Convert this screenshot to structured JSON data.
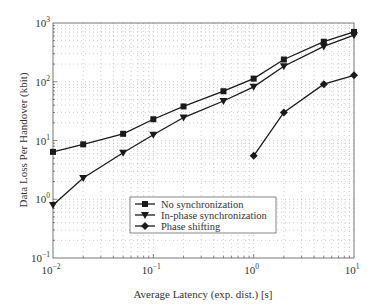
{
  "chart_data": {
    "type": "line",
    "title": "",
    "xlabel": "Average Latency (exp. dist.) [s]",
    "ylabel": "Data Loss Per Handover (kbit)",
    "xscale": "log",
    "yscale": "log",
    "xlim": [
      0.01,
      10
    ],
    "ylim": [
      0.1,
      1000
    ],
    "grid": true,
    "legend_position": "lower center (inside)",
    "x_ticks": [
      {
        "value": 0.01,
        "base": "10",
        "exp": "−2"
      },
      {
        "value": 0.1,
        "base": "10",
        "exp": "−1"
      },
      {
        "value": 1,
        "base": "10",
        "exp": "0"
      },
      {
        "value": 10,
        "base": "10",
        "exp": "1"
      }
    ],
    "y_ticks": [
      {
        "value": 0.1,
        "base": "10",
        "exp": "−1"
      },
      {
        "value": 1,
        "base": "10",
        "exp": "0"
      },
      {
        "value": 10,
        "base": "10",
        "exp": "1"
      },
      {
        "value": 100,
        "base": "10",
        "exp": "2"
      },
      {
        "value": 1000,
        "base": "10",
        "exp": "3"
      }
    ],
    "series": [
      {
        "name": "No synchronization",
        "marker": "square",
        "x": [
          0.01,
          0.02,
          0.05,
          0.1,
          0.2,
          0.5,
          1,
          2,
          5,
          10
        ],
        "values": [
          6.4,
          8.6,
          13,
          23,
          38,
          69,
          113,
          239,
          480,
          705
        ]
      },
      {
        "name": "In-phase synchronization",
        "marker": "triangle-down",
        "x": [
          0.01,
          0.02,
          0.05,
          0.1,
          0.2,
          0.5,
          1,
          2,
          5,
          10
        ],
        "values": [
          0.8,
          2.3,
          6.2,
          12.5,
          24.6,
          47,
          82,
          184,
          400,
          620
        ]
      },
      {
        "name": "Phase shifting",
        "marker": "diamond",
        "x": [
          1,
          2,
          5,
          10
        ],
        "values": [
          5.5,
          30,
          91,
          129
        ]
      }
    ]
  },
  "colors": {
    "line": "#1a1a1a",
    "grid": "#b0b0b0",
    "axis": "#555555"
  }
}
